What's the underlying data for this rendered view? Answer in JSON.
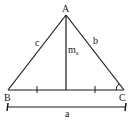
{
  "diagram": {
    "vertices": {
      "A": "A",
      "B": "B",
      "C": "C"
    },
    "sides": {
      "c": "c",
      "b": "b",
      "a": "a"
    },
    "median": {
      "label": "m",
      "subscript": "a"
    },
    "colors": {
      "stroke": "#1a1a1a",
      "background": "#ffffff"
    }
  }
}
